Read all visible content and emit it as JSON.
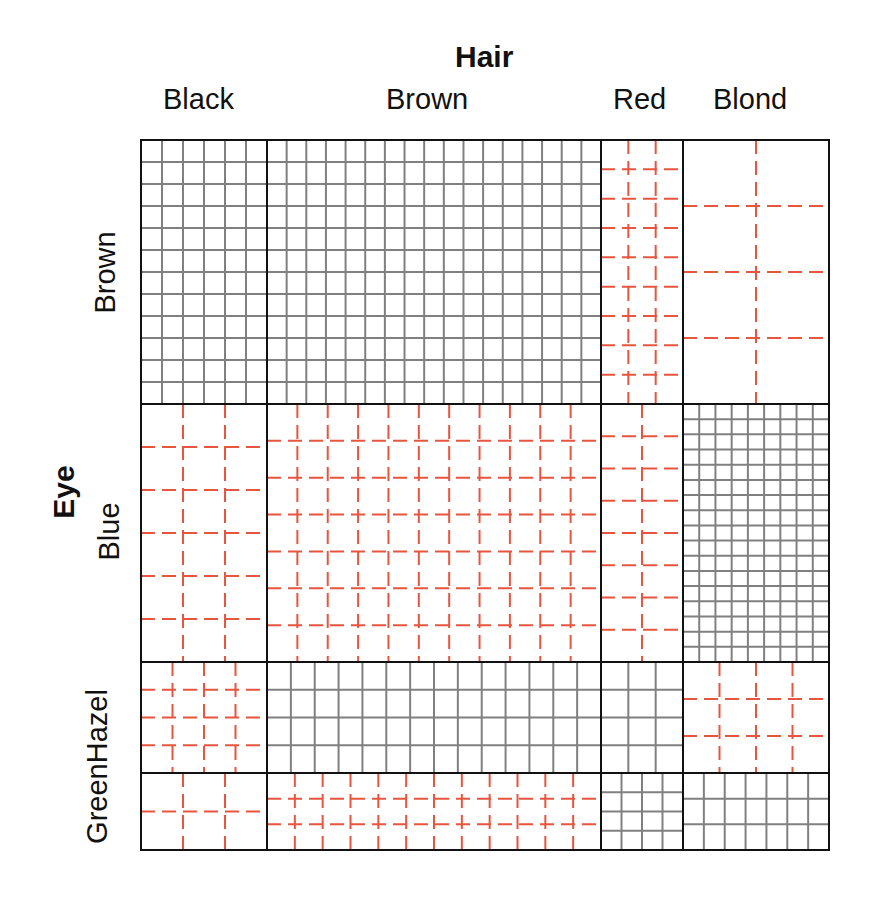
{
  "chart_data": {
    "type": "mosaic",
    "title": "",
    "xlabel": "Hair",
    "ylabel": "Eye",
    "x_categories": [
      "Black",
      "Brown",
      "Red",
      "Blond"
    ],
    "y_categories": [
      "Brown",
      "Blue",
      "Hazel",
      "Green"
    ],
    "y_tick_labels_visible": [
      "Brown",
      "Blue",
      "GreenHazel"
    ],
    "observed": [
      [
        68,
        119,
        26,
        7
      ],
      [
        20,
        84,
        17,
        94
      ],
      [
        15,
        54,
        14,
        10
      ],
      [
        5,
        29,
        14,
        16
      ]
    ],
    "cell_style": [
      [
        "solid",
        "solid",
        "dashed",
        "dashed"
      ],
      [
        "dashed",
        "dashed",
        "dashed",
        "solid"
      ],
      [
        "dashed",
        "solid",
        "solid",
        "dashed"
      ],
      [
        "dashed",
        "dashed",
        "solid",
        "solid"
      ]
    ],
    "grid_divisions": [
      [
        [
          6,
          12
        ],
        [
          17,
          12
        ],
        [
          3,
          9
        ],
        [
          2,
          4
        ]
      ],
      [
        [
          3,
          6
        ],
        [
          11,
          7
        ],
        [
          2,
          8
        ],
        [
          9,
          17
        ]
      ],
      [
        [
          4,
          4
        ],
        [
          14,
          4
        ],
        [
          3,
          4
        ],
        [
          4,
          3
        ]
      ],
      [
        [
          3,
          2
        ],
        [
          12,
          3
        ],
        [
          4,
          4
        ],
        [
          7,
          3
        ]
      ]
    ],
    "legend": "solid gray grid = more than expected; red dashed grid = fewer than expected",
    "colors": {
      "positive": "#808080",
      "negative": "#e8553f",
      "border": "#111111"
    }
  },
  "plot": {
    "x_edges": [
      141,
      267,
      601,
      683,
      829
    ],
    "y_edges": [
      140,
      404,
      662,
      773,
      850
    ]
  },
  "labels": {
    "top_title": "Hair",
    "left_title": "Eye",
    "columns": [
      "Black",
      "Brown",
      "Red",
      "Blond"
    ],
    "rows": [
      "Brown",
      "Blue",
      "GreenHazel"
    ]
  }
}
